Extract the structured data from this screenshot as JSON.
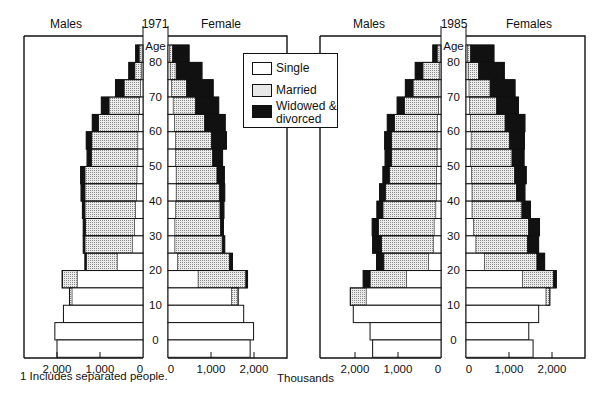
{
  "chart_data": [
    {
      "type": "bar",
      "subtype": "population-pyramid (stacked horizontal)",
      "title": "1971",
      "left_label": "Males",
      "right_label": "Female",
      "center_axis_label": "Age",
      "age_ticks": [
        "80",
        "70",
        "60",
        "50",
        "40",
        "30",
        "20",
        "10",
        "0"
      ],
      "x_ticks_left": [
        "2,000",
        "1,000",
        "0"
      ],
      "x_ticks_right": [
        "0",
        "1,000",
        "2,000"
      ],
      "xlabel": "Thousands",
      "xlim": [
        0,
        2000
      ],
      "categories": [
        "85+",
        "80-84",
        "75-79",
        "70-74",
        "65-69",
        "60-64",
        "55-59",
        "50-54",
        "45-49",
        "40-44",
        "35-39",
        "30-34",
        "25-29",
        "20-24",
        "15-19",
        "10-14",
        "5-9",
        "0-4"
      ],
      "series_order": [
        "Single",
        "Married",
        "Widowed & divorced"
      ],
      "males": [
        [
          20,
          70,
          80
        ],
        [
          40,
          150,
          140
        ],
        [
          60,
          380,
          200
        ],
        [
          80,
          710,
          180
        ],
        [
          110,
          920,
          150
        ],
        [
          120,
          1070,
          130
        ],
        [
          120,
          1080,
          100
        ],
        [
          140,
          1210,
          100
        ],
        [
          150,
          1200,
          90
        ],
        [
          170,
          1180,
          60
        ],
        [
          200,
          1140,
          50
        ],
        [
          250,
          1100,
          40
        ],
        [
          600,
          720,
          30
        ],
        [
          1530,
          340,
          10
        ],
        [
          1650,
          60,
          0
        ],
        [
          1850,
          0,
          0
        ],
        [
          2050,
          0,
          0
        ],
        [
          2000,
          0,
          0
        ]
      ],
      "females": [
        [
          40,
          70,
          380
        ],
        [
          50,
          140,
          600
        ],
        [
          80,
          350,
          620
        ],
        [
          120,
          520,
          540
        ],
        [
          150,
          700,
          480
        ],
        [
          170,
          840,
          350
        ],
        [
          170,
          870,
          230
        ],
        [
          190,
          950,
          170
        ],
        [
          190,
          1010,
          120
        ],
        [
          180,
          1030,
          90
        ],
        [
          160,
          1060,
          70
        ],
        [
          160,
          1100,
          60
        ],
        [
          220,
          1210,
          70
        ],
        [
          700,
          1110,
          40
        ],
        [
          1480,
          150,
          0
        ],
        [
          1760,
          0,
          0
        ],
        [
          1990,
          0,
          0
        ],
        [
          1910,
          0,
          0
        ]
      ]
    },
    {
      "type": "bar",
      "subtype": "population-pyramid (stacked horizontal)",
      "title": "1985",
      "left_label": "Males",
      "right_label": "Females",
      "center_axis_label": "Age",
      "age_ticks": [
        "80",
        "70",
        "60",
        "50",
        "40",
        "30",
        "20",
        "10",
        "0"
      ],
      "x_ticks_left": [
        "2,000",
        "1,000",
        "0"
      ],
      "x_ticks_right": [
        "0",
        "1,000",
        "2,000"
      ],
      "xlabel": "Thousands",
      "xlim": [
        0,
        2000
      ],
      "categories": [
        "85+",
        "80-84",
        "75-79",
        "70-74",
        "65-69",
        "60-64",
        "55-59",
        "50-54",
        "45-49",
        "40-44",
        "35-39",
        "30-34",
        "25-29",
        "20-24",
        "15-19",
        "10-14",
        "5-9",
        "0-4"
      ],
      "series_order": [
        "Single",
        "Married",
        "Widowed & divorced"
      ],
      "males": [
        [
          20,
          70,
          100
        ],
        [
          40,
          380,
          180
        ],
        [
          50,
          600,
          180
        ],
        [
          60,
          790,
          170
        ],
        [
          80,
          1000,
          170
        ],
        [
          90,
          1060,
          160
        ],
        [
          90,
          1060,
          150
        ],
        [
          100,
          1100,
          150
        ],
        [
          110,
          1180,
          140
        ],
        [
          120,
          1230,
          140
        ],
        [
          160,
          1290,
          150
        ],
        [
          180,
          1200,
          210
        ],
        [
          290,
          1040,
          170
        ],
        [
          800,
          850,
          160
        ],
        [
          1740,
          370,
          0
        ],
        [
          2040,
          0,
          0
        ],
        [
          1650,
          0,
          0
        ],
        [
          1590,
          0,
          0
        ]
      ],
      "females": [
        [
          30,
          80,
          540
        ],
        [
          50,
          240,
          600
        ],
        [
          70,
          490,
          580
        ],
        [
          80,
          630,
          510
        ],
        [
          100,
          810,
          460
        ],
        [
          120,
          890,
          350
        ],
        [
          110,
          960,
          280
        ],
        [
          130,
          1000,
          270
        ],
        [
          140,
          1030,
          200
        ],
        [
          140,
          1160,
          200
        ],
        [
          170,
          1280,
          260
        ],
        [
          230,
          1200,
          260
        ],
        [
          430,
          1220,
          180
        ],
        [
          1310,
          720,
          70
        ],
        [
          1860,
          90,
          0
        ],
        [
          1690,
          0,
          0
        ],
        [
          1460,
          0,
          0
        ],
        [
          1560,
          0,
          0
        ]
      ]
    }
  ],
  "legend": {
    "items": [
      {
        "label": "Single",
        "key": "single"
      },
      {
        "label": "Married",
        "key": "married"
      },
      {
        "label": "Widowed &",
        "label2": "divorced",
        "key": "widowed"
      }
    ]
  },
  "footnote": "1  Includes separated people.",
  "xlabel": "Thousands",
  "colors": {
    "single": "#ffffff",
    "married": "#dcdcdc",
    "widowed": "#111111",
    "line": "#111111"
  }
}
